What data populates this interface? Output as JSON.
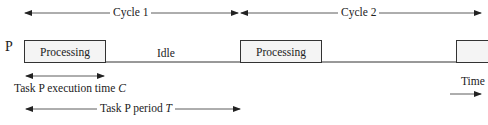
{
  "diagram": {
    "type": "task-timing",
    "process_label": "P",
    "cycles": [
      {
        "label": "Cycle 1"
      },
      {
        "label": "Cycle 2"
      }
    ],
    "segments": [
      {
        "label": "Processing",
        "state": "processing"
      },
      {
        "label": "Idle",
        "state": "idle"
      },
      {
        "label": "Processing",
        "state": "processing"
      },
      {
        "label": "",
        "state": "processing-partial"
      }
    ],
    "annotations": {
      "execution_time": {
        "text": "Task P execution time ",
        "symbol": "C"
      },
      "period": {
        "text": "Task P period ",
        "symbol": "T"
      },
      "time_axis": "Time"
    },
    "colors": {
      "line": "#333333",
      "box_fill": "#f4f4f4",
      "background": "#ffffff"
    }
  }
}
